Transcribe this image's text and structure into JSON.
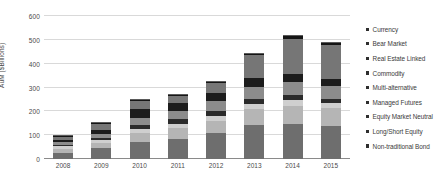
{
  "chart_data": {
    "type": "bar",
    "stacked": true,
    "title": "",
    "xlabel": "",
    "ylabel": "AuM ($Billions)",
    "categories": [
      "2008",
      "2009",
      "2010",
      "2011",
      "2012",
      "2013",
      "2014",
      "2015"
    ],
    "ylim": [
      0,
      600
    ],
    "yticks": [
      0,
      100,
      200,
      300,
      400,
      500,
      600
    ],
    "ytick_labels": [
      "0",
      "100",
      "200",
      "300",
      "400",
      "500",
      "600"
    ],
    "grid": true,
    "legend_position": "right",
    "series": [
      {
        "name": "Non-traditional Bond",
        "color": "#6e6e6e",
        "values": [
          26,
          46,
          73,
          86,
          110,
          142,
          149,
          139
        ]
      },
      {
        "name": "Long/Short Equity",
        "color": "#b5b5b5",
        "values": [
          18,
          22,
          38,
          44,
          50,
          66,
          75,
          74
        ]
      },
      {
        "name": "Equity Market Neutral",
        "color": "#cfcfcf",
        "values": [
          9,
          11,
          17,
          18,
          20,
          23,
          24,
          22
        ]
      },
      {
        "name": "Managed Futures",
        "color": "#2b2b2b",
        "values": [
          7,
          9,
          16,
          21,
          20,
          22,
          20,
          18
        ]
      },
      {
        "name": "Multi-alternative",
        "color": "#8c8c8c",
        "values": [
          12,
          17,
          28,
          33,
          42,
          50,
          56,
          54
        ]
      },
      {
        "name": "Commodity",
        "color": "#1c1c1c",
        "values": [
          8,
          18,
          36,
          32,
          33,
          36,
          32,
          28
        ]
      },
      {
        "name": "Real Estate Linked",
        "color": "#767676",
        "values": [
          13,
          26,
          36,
          32,
          45,
          98,
          148,
          144
        ]
      },
      {
        "name": "Bear Market",
        "color": "#151515",
        "values": [
          4,
          4,
          5,
          4,
          5,
          6,
          12,
          10
        ]
      },
      {
        "name": "Currency",
        "color": "#5a5a5a",
        "values": [
          3,
          2,
          3,
          3,
          3,
          3,
          4,
          3
        ]
      }
    ],
    "totals": [
      100,
      155,
      252,
      273,
      328,
      446,
      520,
      492
    ],
    "legend_entries": [
      "Currency",
      "Bear Market",
      "Real Estate Linked",
      "Commodity",
      "Multi-alternative",
      "Managed Futures",
      "Equity Market Neutral",
      "Long/Short Equity",
      "Non-traditional Bond"
    ]
  },
  "colors": {
    "gridline": "#d9d9d9",
    "axis": "#8a8a8a",
    "tick_text": "#4a4a4a",
    "legend_text": "#3a3a3a",
    "legend_swatch": "#2e2e2e"
  }
}
